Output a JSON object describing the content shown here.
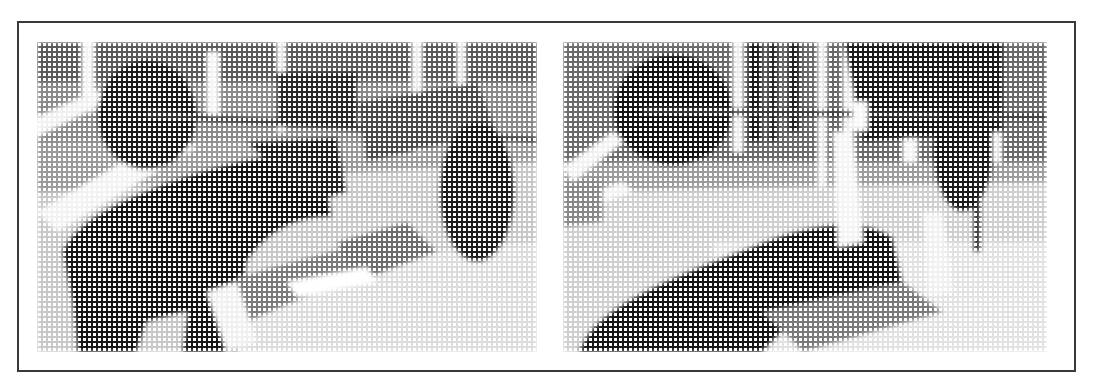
{
  "figure": {
    "panels": [
      {
        "id": "left",
        "description": "Halftone photo: person performing bench press, large barbell plate, power rack",
        "style": "halftone"
      },
      {
        "id": "right",
        "description": "Halftone photo: person lying on bench under barbell, plate and rack in gym",
        "style": "halftone"
      }
    ],
    "colors": {
      "ink": "#1a1a1a",
      "paper": "#ffffff",
      "border": "#3a3a3a"
    }
  }
}
